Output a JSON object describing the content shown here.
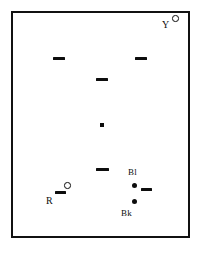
{
  "figure": {
    "type": "scatter-schematic",
    "background_color": "#ffffff",
    "frame": {
      "name": "plot-border",
      "color": "#111111",
      "border_width_px": 2.5,
      "x": 11,
      "y": 11,
      "width": 179,
      "height": 227
    },
    "labels": [
      {
        "id": "label-y",
        "text": "Y",
        "x": 161,
        "y": 19,
        "font_size": 10
      },
      {
        "id": "label-bl",
        "text": "Bl",
        "x": 127,
        "y": 167,
        "font_size": 9
      },
      {
        "id": "label-bk",
        "text": "Bk",
        "x": 120,
        "y": 208,
        "font_size": 9
      },
      {
        "id": "label-r",
        "text": "R",
        "x": 45,
        "y": 195,
        "font_size": 10
      }
    ],
    "markers": {
      "dashes": [
        {
          "id": "dash-upper-left",
          "x": 52,
          "y": 57,
          "width": 12,
          "height": 2.5
        },
        {
          "id": "dash-upper-right",
          "x": 134,
          "y": 57,
          "width": 12,
          "height": 2.5
        },
        {
          "id": "dash-mid-center",
          "x": 95,
          "y": 78,
          "width": 12,
          "height": 3
        },
        {
          "id": "dash-lower-center",
          "x": 95,
          "y": 168,
          "width": 13,
          "height": 3
        },
        {
          "id": "dash-near-r",
          "x": 54,
          "y": 191,
          "width": 11,
          "height": 3
        },
        {
          "id": "dash-near-bl",
          "x": 140,
          "y": 188,
          "width": 11,
          "height": 3
        }
      ],
      "dots": [
        {
          "id": "dot-center",
          "x": 98,
          "y": 122,
          "size": 3.5
        },
        {
          "id": "dot-bl",
          "x": 131,
          "y": 183,
          "size": 5
        },
        {
          "id": "dot-bk",
          "x": 131,
          "y": 199,
          "size": 5
        }
      ],
      "open_circles": [
        {
          "id": "circle-y",
          "x": 171,
          "y": 14,
          "size": 6.5
        },
        {
          "id": "circle-r",
          "x": 63,
          "y": 182,
          "size": 6.5
        }
      ]
    },
    "marker_color": "#0d0d0d"
  }
}
